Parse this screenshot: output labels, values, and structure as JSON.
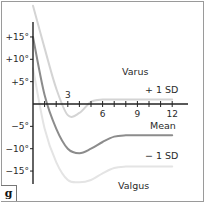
{
  "panel_label": "g",
  "chart_data": {
    "type": "line",
    "title": "",
    "xlabel": "",
    "ylabel": "",
    "x_ticks": [
      3,
      6,
      9,
      12
    ],
    "x_tick_labels": [
      "3",
      "6",
      "9",
      "12"
    ],
    "x_minor_ticks": [
      1,
      2,
      3,
      4,
      5,
      6,
      7,
      8,
      9,
      10,
      11,
      12
    ],
    "y_ticks": [
      15,
      10,
      5,
      -5,
      -10,
      -15
    ],
    "y_tick_labels": [
      "+15°",
      "+10°",
      "+5°",
      "−5°",
      "−10°",
      "−15°"
    ],
    "xlim": [
      0,
      13
    ],
    "ylim": [
      -19,
      23
    ],
    "grid": false,
    "annotations": {
      "upper_region": "Varus",
      "lower_region": "Valgus"
    },
    "x": [
      0,
      1,
      2,
      3,
      4,
      5,
      6,
      7,
      8,
      9,
      10,
      11,
      12
    ],
    "series": [
      {
        "name": "+ 1 SD",
        "color": "#d4d4d4",
        "values": [
          22,
          12.5,
          3.5,
          -2.5,
          -2,
          0.5,
          1,
          1,
          1,
          1,
          1,
          1,
          1
        ]
      },
      {
        "name": "Mean",
        "color": "#8c8c8c",
        "values": [
          15,
          2,
          -5.5,
          -10,
          -11,
          -10,
          -8.5,
          -7.3,
          -7,
          -7,
          -7,
          -7,
          -7
        ]
      },
      {
        "name": "− 1 SD",
        "color": "#e4e4e4",
        "values": [
          8,
          -5.5,
          -13,
          -17,
          -17.5,
          -17,
          -15.5,
          -14.3,
          -14,
          -14,
          -14,
          -14,
          -14
        ]
      }
    ]
  }
}
